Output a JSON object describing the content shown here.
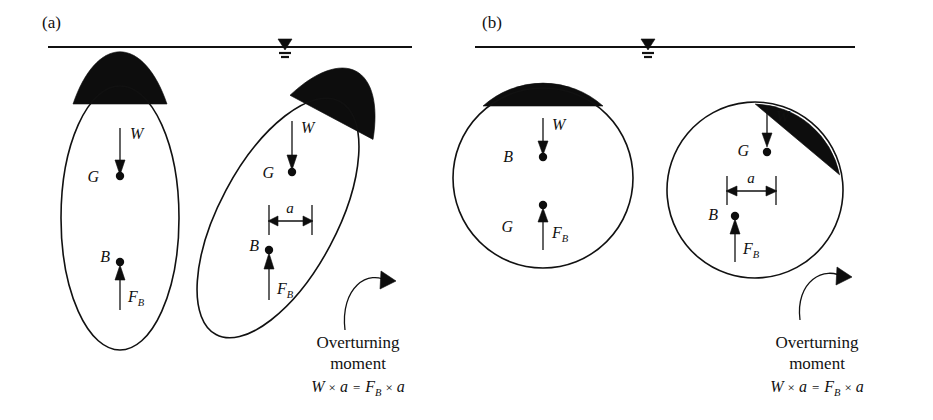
{
  "figure": {
    "type": "stability-of-floating-bodies-diagram",
    "background": "#ffffff",
    "ink_color": "#111111",
    "submerged_fill": "#0d0d0d"
  },
  "panels": [
    {
      "id": "a",
      "label": "(a)",
      "body_shape": "ellipse",
      "waterline": {
        "symbol": "water-level-triangle"
      },
      "bodies": [
        {
          "state": "upright",
          "points": [
            {
              "name": "G",
              "label": "G",
              "role": "center-of-gravity",
              "position": "upper",
              "force": {
                "label": "W",
                "direction": "down"
              }
            },
            {
              "name": "B",
              "label": "B",
              "role": "center-of-buoyancy",
              "position": "lower",
              "force": {
                "label": "F",
                "sub": "B",
                "direction": "up"
              }
            }
          ]
        },
        {
          "state": "tilted",
          "dimension": {
            "label": "a"
          },
          "points": [
            {
              "name": "G",
              "label": "G",
              "role": "center-of-gravity",
              "position": "upper",
              "force": {
                "label": "W",
                "direction": "down"
              }
            },
            {
              "name": "B",
              "label": "B",
              "role": "center-of-buoyancy",
              "position": "lower",
              "force": {
                "label": "F",
                "sub": "B",
                "direction": "up"
              }
            }
          ]
        }
      ],
      "moment": {
        "caption_line1": "Overturning",
        "caption_line2": "moment",
        "equation": {
          "left_var": "W",
          "times1": "×",
          "left_arm": "a",
          "equals": "=",
          "right_var": "F",
          "right_sub": "B",
          "times2": "×",
          "right_arm": "a"
        }
      }
    },
    {
      "id": "b",
      "label": "(b)",
      "body_shape": "circle",
      "waterline": {
        "symbol": "water-level-triangle"
      },
      "bodies": [
        {
          "state": "upright",
          "points": [
            {
              "name": "B",
              "label": "B",
              "role": "center-of-buoyancy",
              "position": "upper",
              "force": {
                "label": "W",
                "direction": "down"
              }
            },
            {
              "name": "G",
              "label": "G",
              "role": "center-of-gravity",
              "position": "lower",
              "force": {
                "label": "F",
                "sub": "B",
                "direction": "up"
              }
            }
          ]
        },
        {
          "state": "tilted",
          "dimension": {
            "label": "a"
          },
          "points": [
            {
              "name": "G",
              "label": "G",
              "role": "center-of-gravity",
              "position": "upper",
              "force": {
                "label": "W",
                "direction": "down"
              }
            },
            {
              "name": "B",
              "label": "B",
              "role": "center-of-buoyancy",
              "position": "lower",
              "force": {
                "label": "F",
                "sub": "B",
                "direction": "up"
              }
            }
          ]
        }
      ],
      "moment": {
        "caption_line1": "Overturning",
        "caption_line2": "moment",
        "equation": {
          "left_var": "W",
          "times1": "×",
          "left_arm": "a",
          "equals": "=",
          "right_var": "F",
          "right_sub": "B",
          "times2": "×",
          "right_arm": "a"
        }
      }
    }
  ]
}
